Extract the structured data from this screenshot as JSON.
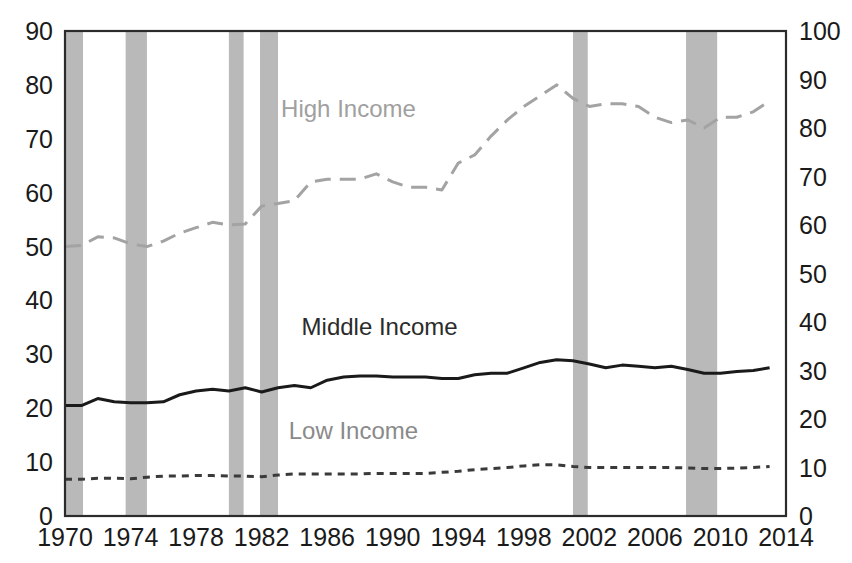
{
  "figure": {
    "background_color": "#ffffff",
    "frame_color": "#2b2b2b",
    "recession_band_color": "#b9b9b9"
  },
  "axes": {
    "left": {
      "ticks": [
        "0",
        "10",
        "20",
        "30",
        "40",
        "50",
        "60",
        "70",
        "80",
        "90"
      ],
      "min": 0,
      "max": 90,
      "step": 10
    },
    "right": {
      "ticks": [
        "0",
        "10",
        "20",
        "30",
        "40",
        "50",
        "60",
        "70",
        "80",
        "90",
        "100"
      ],
      "min": 0,
      "max": 100,
      "step": 10
    },
    "bottom": {
      "ticks": [
        "1970",
        "1974",
        "1978",
        "1982",
        "1986",
        "1990",
        "1994",
        "1998",
        "2002",
        "2006",
        "2010",
        "2014"
      ],
      "min": 1970,
      "max": 2014,
      "step": 4
    }
  },
  "series_labels": {
    "high_income": {
      "text": "High Income",
      "x": 1987.3,
      "y_left": 74.0,
      "color": "#a0a0a0"
    },
    "middle_income": {
      "text": "Middle Income",
      "x": 1989.2,
      "y_left": 33.6,
      "color": "#2b2b2b"
    },
    "low_income": {
      "text": "Low Income",
      "x": 1987.6,
      "y_left": 14.3,
      "color": "#8a8a8a"
    }
  },
  "chart_data": {
    "type": "line",
    "title": "",
    "subtitle": "",
    "xlabel": "",
    "ylabel": "",
    "xlim": [
      1970,
      2014
    ],
    "ylim_left": [
      0,
      90
    ],
    "ylim_right": [
      0,
      100
    ],
    "grid": false,
    "legend_position": "inline-annotations",
    "note": "Left axis values shown; right axis is the same data rescaled 0-100. Shaded vertical bands mark US recessions.",
    "x": [
      1970,
      1971,
      1972,
      1973,
      1974,
      1975,
      1976,
      1977,
      1978,
      1979,
      1980,
      1981,
      1982,
      1983,
      1984,
      1985,
      1986,
      1987,
      1988,
      1989,
      1990,
      1991,
      1992,
      1993,
      1994,
      1995,
      1996,
      1997,
      1998,
      1999,
      2000,
      2001,
      2002,
      2003,
      2004,
      2005,
      2006,
      2007,
      2008,
      2009,
      2010,
      2011,
      2012,
      2013
    ],
    "series": [
      {
        "name": "High Income",
        "color": "#a3a3a3",
        "style": "long-dash",
        "axis": "left",
        "values": [
          50.0,
          50.2,
          51.8,
          51.6,
          50.5,
          50.0,
          51.0,
          52.5,
          53.5,
          54.5,
          54.0,
          54.2,
          57.5,
          58.0,
          58.5,
          62.0,
          62.5,
          62.5,
          62.5,
          63.5,
          62.0,
          61.0,
          61.0,
          60.5,
          65.5,
          67.0,
          70.5,
          73.5,
          76.0,
          78.0,
          80.0,
          77.5,
          76.0,
          76.5,
          76.5,
          76.0,
          74.0,
          73.0,
          73.5,
          72.0,
          74.0,
          74.0,
          75.0,
          77.0
        ]
      },
      {
        "name": "Middle Income",
        "color": "#1a1a1a",
        "style": "solid",
        "axis": "left",
        "values": [
          20.5,
          20.5,
          21.8,
          21.2,
          21.0,
          21.0,
          21.2,
          22.5,
          23.2,
          23.5,
          23.2,
          23.8,
          23.0,
          23.8,
          24.2,
          23.8,
          25.2,
          25.8,
          26.0,
          26.0,
          25.8,
          25.8,
          25.8,
          25.5,
          25.5,
          26.2,
          26.5,
          26.5,
          27.5,
          28.5,
          29.0,
          28.8,
          28.2,
          27.5,
          28.0,
          27.8,
          27.5,
          27.8,
          27.2,
          26.5,
          26.5,
          26.8,
          27.0,
          27.5
        ]
      },
      {
        "name": "Low Income",
        "color": "#3a3a3a",
        "style": "short-dash",
        "axis": "left",
        "values": [
          6.8,
          6.8,
          7.0,
          7.0,
          6.9,
          7.2,
          7.4,
          7.4,
          7.5,
          7.5,
          7.4,
          7.4,
          7.3,
          7.6,
          7.8,
          7.8,
          7.8,
          7.8,
          7.8,
          7.9,
          7.9,
          7.9,
          7.9,
          8.1,
          8.3,
          8.6,
          8.8,
          9.0,
          9.3,
          9.5,
          9.5,
          9.2,
          9.0,
          9.0,
          9.0,
          9.0,
          9.0,
          9.0,
          8.9,
          8.8,
          8.8,
          8.9,
          9.0,
          9.2
        ]
      }
    ],
    "recession_bands": [
      {
        "start": 1970.0,
        "end": 1971.1,
        "label": "1969-70 recession"
      },
      {
        "start": 1973.7,
        "end": 1975.0,
        "label": "1973-75 recession"
      },
      {
        "start": 1980.0,
        "end": 1980.9,
        "label": "1980 recession"
      },
      {
        "start": 1981.9,
        "end": 1983.0,
        "label": "1981-82 recession"
      },
      {
        "start": 2001.0,
        "end": 2001.9,
        "label": "2001 recession"
      },
      {
        "start": 2007.9,
        "end": 2009.8,
        "label": "2008-09 recession"
      }
    ]
  }
}
